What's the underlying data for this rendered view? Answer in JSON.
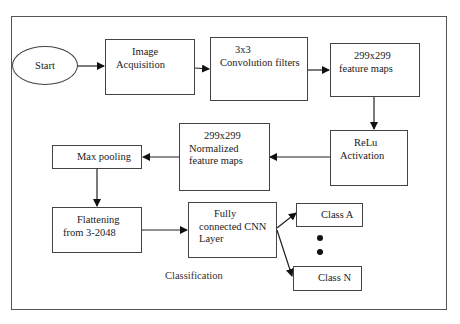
{
  "diagram": {
    "start": "Start",
    "image_acquisition": [
      "Image",
      "Acquisition"
    ],
    "convolution": [
      "3x3",
      "Convolution filters"
    ],
    "feature_maps": [
      "299x299",
      "feature maps"
    ],
    "relu": [
      "ReLu",
      "Activation"
    ],
    "normalized": [
      "299x299",
      "Normalized",
      "feature maps"
    ],
    "max_pooling": "Max pooling",
    "flattening": [
      "Flattening",
      "from 3-2048"
    ],
    "fully_connected": [
      "Fully",
      "connected CNN",
      "Layer"
    ],
    "class_a": "Class A",
    "class_n": "Class N",
    "classification": "Classification"
  }
}
